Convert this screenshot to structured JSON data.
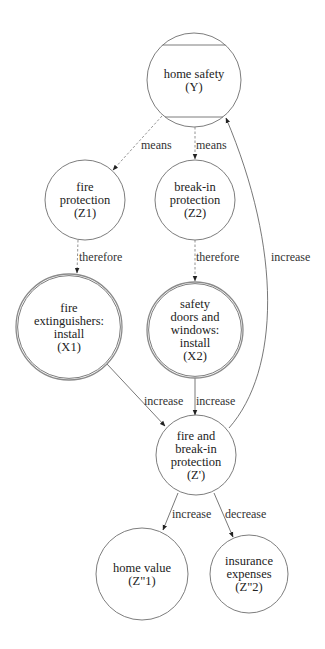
{
  "diagram": {
    "width": 325,
    "height": 649,
    "colors": {
      "stroke": "#6e6e6e",
      "text": "#222222",
      "background": "#ffffff"
    },
    "nodes": [
      {
        "id": "Y",
        "lines": [
          "home safety",
          "(Y)"
        ],
        "cx": 194,
        "cy": 80,
        "r": 47,
        "style": "chorded"
      },
      {
        "id": "Z1",
        "lines": [
          "fire",
          "protection",
          "(Z1)"
        ],
        "cx": 85,
        "cy": 200,
        "r": 40,
        "style": "single"
      },
      {
        "id": "Z2",
        "lines": [
          "break-in",
          "protection",
          "(Z2)"
        ],
        "cx": 195,
        "cy": 200,
        "r": 40,
        "style": "single"
      },
      {
        "id": "X1",
        "lines": [
          "fire",
          "extinguishers:",
          "install",
          "(X1)"
        ],
        "cx": 69,
        "cy": 327,
        "r": 53,
        "style": "double"
      },
      {
        "id": "X2",
        "lines": [
          "safety",
          "doors and",
          "windows:",
          "install",
          "(X2)"
        ],
        "cx": 195,
        "cy": 330,
        "r": 48,
        "style": "double"
      },
      {
        "id": "Zp",
        "lines": [
          "fire and",
          "break-in",
          "protection",
          "(Z')"
        ],
        "cx": 196,
        "cy": 455,
        "r": 40,
        "style": "single"
      },
      {
        "id": "Zpp1",
        "lines": [
          "home value",
          "(Z\"1)"
        ],
        "cx": 142,
        "cy": 574,
        "r": 46,
        "style": "single"
      },
      {
        "id": "Zpp2",
        "lines": [
          "insurance",
          "expenses",
          "(Z\"2)"
        ],
        "cx": 249,
        "cy": 574,
        "r": 39,
        "style": "single"
      }
    ],
    "edges": [
      {
        "from": "Y",
        "to": "Z1",
        "label": "means",
        "dashed": true,
        "path": "M162,116 L113,170",
        "tip": [
          113,
          170
        ],
        "angle": 132,
        "lx": 141,
        "ly": 149
      },
      {
        "from": "Y",
        "to": "Z2",
        "label": "means",
        "dashed": true,
        "path": "M195,127 L195,159",
        "tip": [
          195,
          159
        ],
        "angle": 90,
        "lx": 196,
        "ly": 149
      },
      {
        "from": "Z1",
        "to": "X1",
        "label": "therefore",
        "dashed": true,
        "path": "M78,240 L77,273",
        "tip": [
          77,
          273
        ],
        "angle": 92,
        "lx": 79,
        "ly": 261
      },
      {
        "from": "Z2",
        "to": "X2",
        "label": "therefore",
        "dashed": true,
        "path": "M195,240 L195,281",
        "tip": [
          195,
          281
        ],
        "angle": 90,
        "lx": 196,
        "ly": 261
      },
      {
        "from": "X1",
        "to": "Zp",
        "label": "increase",
        "dashed": false,
        "path": "M107,364 L165,426",
        "tip": [
          165,
          426
        ],
        "angle": 47,
        "lx": 144,
        "ly": 405
      },
      {
        "from": "X2",
        "to": "Zp",
        "label": "increase",
        "dashed": false,
        "path": "M195,378 L195,415",
        "tip": [
          195,
          415
        ],
        "angle": 90,
        "lx": 196,
        "ly": 405
      },
      {
        "from": "Zp",
        "to": "Y",
        "label": "increase",
        "dashed": false,
        "path": "M229,428 C280,370 282,250 226,118",
        "tip": [
          226,
          118
        ],
        "angle": -113,
        "lx": 271,
        "ly": 261
      },
      {
        "from": "Zp",
        "to": "Zpp1",
        "label": "increase",
        "dashed": false,
        "path": "M178,493 L163,530",
        "tip": [
          163,
          530
        ],
        "angle": 112,
        "lx": 172,
        "ly": 518
      },
      {
        "from": "Zp",
        "to": "Zpp2",
        "label": "decrease",
        "dashed": false,
        "path": "M214,493 L233,537",
        "tip": [
          233,
          537
        ],
        "angle": 66,
        "lx": 225,
        "ly": 518
      }
    ]
  }
}
